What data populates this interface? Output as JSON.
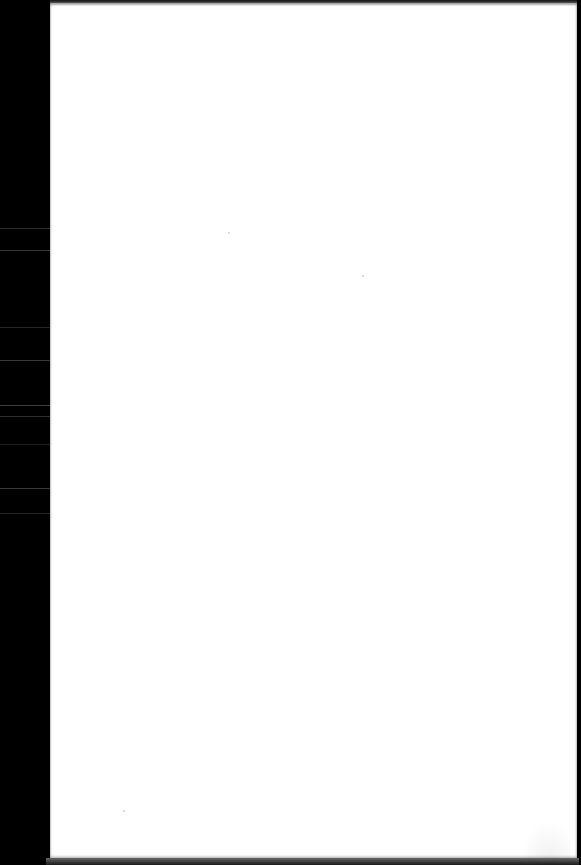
{
  "document": {
    "type": "scanned-page",
    "content": "",
    "colors": {
      "scanner_background": "#000000",
      "paper": "#ffffff"
    }
  }
}
